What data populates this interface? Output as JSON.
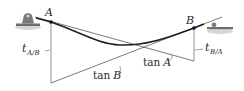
{
  "figure": {
    "type": "beam-deflection-tangent-diagram",
    "points": {
      "A": {
        "label": "A"
      },
      "B": {
        "label": "B"
      }
    },
    "deviations": {
      "t_AB": {
        "main": "t",
        "sub": "A/B"
      },
      "t_BA": {
        "main": "t",
        "sub": "B/A"
      }
    },
    "tangents": {
      "tanA": {
        "label": "tan A",
        "fn": "tan",
        "var": "A"
      },
      "tanB": {
        "label": "tan B",
        "fn": "tan",
        "var": "B"
      }
    },
    "supports": {
      "left": "pin-support",
      "right": "roller-support"
    },
    "colors": {
      "line": "#2a2a2a",
      "thin": "#555555",
      "ground": "#bdbdbd",
      "support": "#6e6e6e"
    }
  }
}
